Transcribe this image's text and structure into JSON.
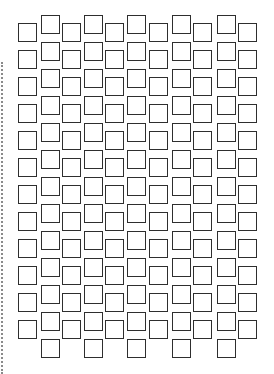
{
  "pattern": {
    "description": "Staggered grid of outlined squares",
    "square_size": 19,
    "border_color": "#2e2e2e",
    "background": "#ffffff",
    "row_step": 27,
    "columns": [
      {
        "x": 18,
        "top": 23,
        "count": 12
      },
      {
        "x": 41,
        "top": 15,
        "count": 13
      },
      {
        "x": 62,
        "top": 23,
        "count": 12
      },
      {
        "x": 84,
        "top": 15,
        "count": 13
      },
      {
        "x": 105,
        "top": 23,
        "count": 12
      },
      {
        "x": 127,
        "top": 15,
        "count": 13
      },
      {
        "x": 149,
        "top": 23,
        "count": 12
      },
      {
        "x": 172,
        "top": 15,
        "count": 13
      },
      {
        "x": 193,
        "top": 23,
        "count": 12
      },
      {
        "x": 217,
        "top": 15,
        "count": 13
      },
      {
        "x": 238,
        "top": 23,
        "count": 12
      }
    ]
  },
  "edge_line": {
    "style": "dotted",
    "color": "#8a8a8a"
  }
}
